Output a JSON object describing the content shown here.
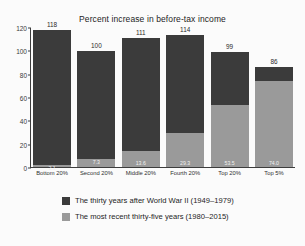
{
  "chart_data": {
    "type": "bar",
    "stacked": true,
    "title": "Percent increase in before-tax income",
    "xlabel": "",
    "ylabel": "",
    "ylim": [
      0,
      120
    ],
    "yticks": [
      0,
      20,
      40,
      60,
      80,
      100,
      120
    ],
    "ytick_labels": [
      "0",
      "20",
      "40",
      "60",
      "80",
      "100",
      "120"
    ],
    "grid": false,
    "legend_position": "bottom",
    "categories": [
      "Bottom 20%",
      "Second 20%",
      "Middle 20%",
      "Fourth 20%",
      "Top 20%",
      "Top 5%"
    ],
    "series": [
      {
        "name": "The thirty years after World War II (1949–1979)",
        "color": "#3b3b3b",
        "values": [
          118,
          100,
          111,
          114,
          99,
          86
        ],
        "value_labels": [
          "118",
          "100",
          "111",
          "114",
          "99",
          "86"
        ]
      },
      {
        "name": "The most recent thirty-five years (1980–2015)",
        "color": "#9a9a9a",
        "values": [
          2.1,
          7.3,
          13.6,
          29.3,
          53.5,
          74.0
        ],
        "value_labels": [
          "2.1",
          "7.3",
          "13.6",
          "29.3",
          "53.5",
          "74.0"
        ]
      }
    ],
    "total_labels": [
      "118",
      "100",
      "111",
      "114",
      "99",
      "86"
    ]
  },
  "legend": {
    "entries": [
      "The thirty years after World War II (1949–1979)",
      "The most recent thirty-five years (1980–2015)"
    ]
  },
  "colors": {
    "dark": "#3b3b3b",
    "light": "#9a9a9a",
    "axis": "#3d3d3d",
    "background": "#fbfbfb"
  }
}
